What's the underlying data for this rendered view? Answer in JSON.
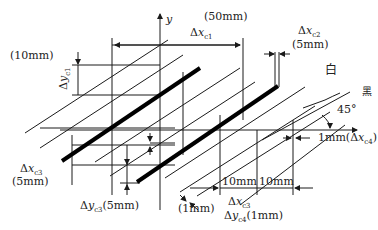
{
  "diagram": {
    "axes": {
      "y_label": "y"
    },
    "labels": {
      "top_width": "(50mm)",
      "dx_c1_prefix": "Δ",
      "dx_c1_var": "x",
      "dx_c1_sub": "c1",
      "dx_c2_prefix": "Δ",
      "dx_c2_var": "x",
      "dx_c2_sub": "c2",
      "dx_c2_value": "(5mm)",
      "left_height": "(10mm)",
      "dy_c1_prefix": "Δ",
      "dy_c1_var": "y",
      "dy_c1_sub": "c1",
      "white": "白",
      "black": "黑",
      "angle": "45°",
      "dx_c4_label": "1mm(Δ",
      "dx_c4_var": "x",
      "dx_c4_sub": "c4",
      "dx_c4_close": ")",
      "dx_c3_left_prefix": "Δ",
      "dx_c3_left_var": "x",
      "dx_c3_left_sub": "c3",
      "dx_c3_left_value": "(5mm)",
      "dy_c3_prefix": "Δ",
      "dy_c3_var": "y",
      "dy_c3_sub": "c3",
      "dy_c3_value": "(5mm)",
      "one_mm": "(1mm)",
      "ten_mm_1": "10mm",
      "ten_mm_2": "10mm",
      "dx_c3_bottom_prefix": "Δ",
      "dx_c3_bottom_var": "x",
      "dx_c3_bottom_sub": "c3",
      "dy_c4_prefix": "Δ",
      "dy_c4_var": "y",
      "dy_c4_sub": "c4",
      "dy_c4_value": "(1mm)"
    },
    "colors": {
      "line": "#1a1a1a",
      "text": "#222222",
      "background": "#ffffff"
    }
  }
}
